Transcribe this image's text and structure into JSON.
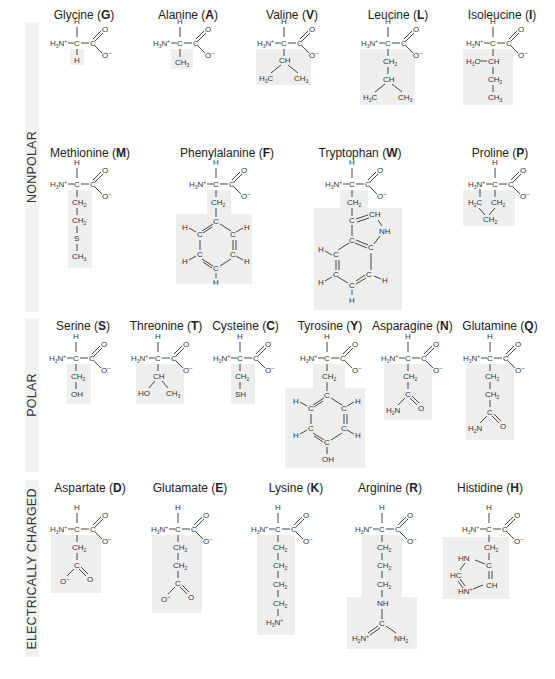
{
  "categories": [
    {
      "label": "NONPOLAR",
      "top": 22,
      "height": 290
    },
    {
      "label": "POLAR",
      "top": 318,
      "height": 154
    },
    {
      "label": "ELECTRICALLY CHARGED",
      "top": 480,
      "height": 177
    }
  ],
  "backbone": {
    "amine": "H3N+",
    "alpha_c": "C",
    "alpha_h": "H",
    "carboxyl_c": "C",
    "carbonyl_o": "O",
    "carboxylate_o": "O−"
  },
  "amino_acids": [
    {
      "name": "Glycine",
      "code": "G",
      "category": "NONPOLAR",
      "side_chain": [
        "H"
      ]
    },
    {
      "name": "Alanine",
      "code": "A",
      "category": "NONPOLAR",
      "side_chain": [
        "CH3"
      ]
    },
    {
      "name": "Valine",
      "code": "V",
      "category": "NONPOLAR",
      "side_chain": [
        "CH",
        "H3C",
        "CH3"
      ]
    },
    {
      "name": "Leucine",
      "code": "L",
      "category": "NONPOLAR",
      "side_chain": [
        "CH2",
        "CH",
        "H3C",
        "CH3"
      ]
    },
    {
      "name": "Isoleucine",
      "code": "I",
      "category": "NONPOLAR",
      "side_chain": [
        "H3C",
        "CH",
        "CH2",
        "CH3"
      ]
    },
    {
      "name": "Methionine",
      "code": "M",
      "category": "NONPOLAR",
      "side_chain": [
        "CH2",
        "CH2",
        "S",
        "CH3"
      ]
    },
    {
      "name": "Phenylalanine",
      "code": "F",
      "category": "NONPOLAR",
      "side_chain": [
        "CH2",
        "C6H5 (benzene ring)"
      ]
    },
    {
      "name": "Tryptophan",
      "code": "W",
      "category": "NONPOLAR",
      "side_chain": [
        "CH2",
        "indole ring",
        "CH",
        "NH"
      ]
    },
    {
      "name": "Proline",
      "code": "P",
      "category": "NONPOLAR",
      "side_chain": [
        "H2C",
        "CH2",
        "CH2"
      ]
    },
    {
      "name": "Serine",
      "code": "S",
      "category": "POLAR",
      "side_chain": [
        "CH2",
        "OH"
      ]
    },
    {
      "name": "Threonine",
      "code": "T",
      "category": "POLAR",
      "side_chain": [
        "CH",
        "HO",
        "CH3"
      ]
    },
    {
      "name": "Cysteine",
      "code": "C",
      "category": "POLAR",
      "side_chain": [
        "CH2",
        "SH"
      ]
    },
    {
      "name": "Tyrosine",
      "code": "Y",
      "category": "POLAR",
      "side_chain": [
        "CH2",
        "phenol ring",
        "OH"
      ]
    },
    {
      "name": "Asparagine",
      "code": "N",
      "category": "POLAR",
      "side_chain": [
        "CH2",
        "C",
        "H2N",
        "O"
      ]
    },
    {
      "name": "Glutamine",
      "code": "Q",
      "category": "POLAR",
      "side_chain": [
        "CH2",
        "CH2",
        "C",
        "H2N",
        "O"
      ]
    },
    {
      "name": "Aspartate",
      "code": "D",
      "category": "ELECTRICALLY CHARGED",
      "side_chain": [
        "CH2",
        "C",
        "O−",
        "O"
      ]
    },
    {
      "name": "Glutamate",
      "code": "E",
      "category": "ELECTRICALLY CHARGED",
      "side_chain": [
        "CH2",
        "CH2",
        "C",
        "O−",
        "O"
      ]
    },
    {
      "name": "Lysine",
      "code": "K",
      "category": "ELECTRICALLY CHARGED",
      "side_chain": [
        "CH2",
        "CH2",
        "CH2",
        "CH2",
        "H3N+"
      ]
    },
    {
      "name": "Arginine",
      "code": "R",
      "category": "ELECTRICALLY CHARGED",
      "side_chain": [
        "CH2",
        "CH2",
        "CH2",
        "NH",
        "C",
        "H2N+",
        "NH2"
      ]
    },
    {
      "name": "Histidine",
      "code": "H",
      "category": "ELECTRICALLY CHARGED",
      "side_chain": [
        "CH2",
        "C",
        "HN",
        "HC",
        "HN+",
        "CH"
      ]
    }
  ]
}
